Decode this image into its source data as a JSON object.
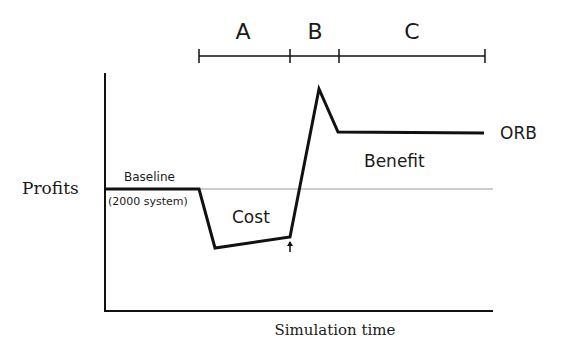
{
  "diagram": {
    "phases": [
      {
        "label": "A"
      },
      {
        "label": "B"
      },
      {
        "label": "C"
      }
    ],
    "y_axis_label": "Profits",
    "x_axis_label": "Simulation time",
    "annotations": {
      "baseline": "Baseline",
      "baseline_sub": "(2000 system)",
      "cost": "Cost",
      "benefit": "Benefit",
      "series_end_label": "ORB"
    },
    "colors": {
      "line": "#111111",
      "baseline_reference": "#999999",
      "background": "#ffffff"
    }
  }
}
